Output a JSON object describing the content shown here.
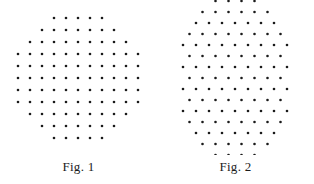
{
  "page": {
    "background_color": "#ffffff",
    "width": 314,
    "height": 184,
    "dot_color": "#1a1a1a",
    "caption_color": "#1c1c1c"
  },
  "figures": [
    {
      "id": "fig-1",
      "caption": "Fig. 1",
      "lattice_type": "square",
      "total_dots": 97,
      "dot_radius": 1.3,
      "spacing_x": 12,
      "spacing_y": 12,
      "center_x": 78,
      "center_y": 78,
      "rows": [
        {
          "count": 5,
          "offset_index": -2
        },
        {
          "count": 7,
          "offset_index": -3
        },
        {
          "count": 9,
          "offset_index": -4
        },
        {
          "count": 11,
          "offset_index": -5
        },
        {
          "count": 11,
          "offset_index": -5
        },
        {
          "count": 11,
          "offset_index": -5
        },
        {
          "count": 11,
          "offset_index": -5
        },
        {
          "count": 11,
          "offset_index": -5
        },
        {
          "count": 9,
          "offset_index": -4
        },
        {
          "count": 7,
          "offset_index": -3
        },
        {
          "count": 5,
          "offset_index": -2
        }
      ]
    },
    {
      "id": "fig-2",
      "caption": "Fig. 2",
      "lattice_type": "hexagonal",
      "total_dots": 109,
      "dot_radius": 1.3,
      "spacing_x": 13,
      "spacing_y": 11,
      "center_x": 78,
      "center_y": 78,
      "rows": [
        {
          "count": 4,
          "offset_index": -1.5,
          "stagger": 0.5
        },
        {
          "count": 6,
          "offset_index": -2.5,
          "stagger": 0.0
        },
        {
          "count": 7,
          "offset_index": -3.0,
          "stagger": 0.5
        },
        {
          "count": 8,
          "offset_index": -3.5,
          "stagger": 0.0
        },
        {
          "count": 9,
          "offset_index": -4.0,
          "stagger": 0.5
        },
        {
          "count": 8,
          "offset_index": -3.5,
          "stagger": 0.0
        },
        {
          "count": 9,
          "offset_index": -4.0,
          "stagger": 0.5
        },
        {
          "count": 8,
          "offset_index": -3.5,
          "stagger": 0.0
        },
        {
          "count": 9,
          "offset_index": -4.0,
          "stagger": 0.5
        },
        {
          "count": 8,
          "offset_index": -3.5,
          "stagger": 0.0
        },
        {
          "count": 9,
          "offset_index": -4.0,
          "stagger": 0.5
        },
        {
          "count": 8,
          "offset_index": -3.5,
          "stagger": 0.0
        },
        {
          "count": 7,
          "offset_index": -3.0,
          "stagger": 0.5
        },
        {
          "count": 6,
          "offset_index": -2.5,
          "stagger": 0.0
        },
        {
          "count": 4,
          "offset_index": -1.5,
          "stagger": 0.5
        }
      ]
    }
  ]
}
